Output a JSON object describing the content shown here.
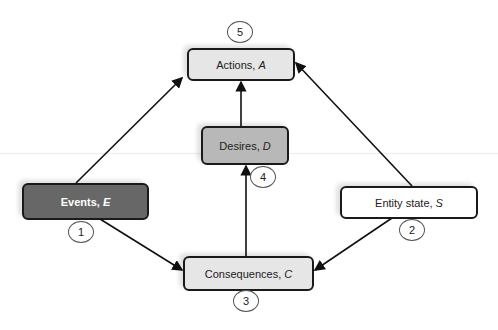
{
  "diagram": {
    "nodes": {
      "actions": {
        "label": "Actions,",
        "symbol": "A",
        "fill": "#e6e6e6"
      },
      "desires": {
        "label": "Desires,",
        "symbol": "D",
        "fill": "#b8b8b8"
      },
      "events": {
        "label": "Events,",
        "symbol": "E",
        "fill": "#676767",
        "text_color": "#ffffff"
      },
      "entity_state": {
        "label": "Entity state,",
        "symbol": "S",
        "fill": "#ffffff"
      },
      "consequences": {
        "label": "Consequences,",
        "symbol": "C",
        "fill": "#e6e6e6"
      }
    },
    "badges": {
      "events": "1",
      "entity_state": "2",
      "consequences": "3",
      "desires": "4",
      "actions": "5"
    },
    "edges": [
      {
        "from": "Events, E",
        "to": "Actions, A"
      },
      {
        "from": "Entity state, S",
        "to": "Actions, A"
      },
      {
        "from": "Desires, D",
        "to": "Actions, A"
      },
      {
        "from": "Consequences, C",
        "to": "Desires, D"
      },
      {
        "from": "Events, E",
        "to": "Consequences, C"
      },
      {
        "from": "Entity state, S",
        "to": "Consequences, C"
      }
    ]
  }
}
